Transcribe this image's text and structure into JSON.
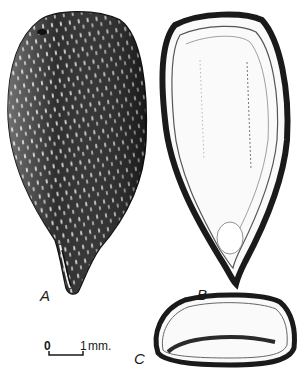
{
  "figure": {
    "panels": [
      {
        "id": "A",
        "label": "A",
        "description": "Seed exterior view, dark speckled testa, tapering to pointed base"
      },
      {
        "id": "B",
        "label": "B",
        "description": "Longitudinal section of seed showing thick testa and white interior"
      },
      {
        "id": "C",
        "label": "C",
        "description": "Transverse section of seed, oval, with dark band across interior"
      }
    ],
    "scale_bar": {
      "start_label": "0",
      "end_label": "1",
      "unit": "mm."
    },
    "colors": {
      "ink": "#1a1a1a",
      "paper": "#ffffff",
      "testa_dark": "#2a2a2a"
    }
  }
}
